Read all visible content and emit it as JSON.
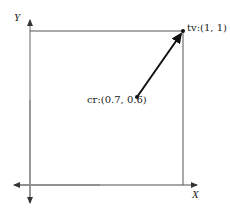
{
  "diagram": {
    "axes": {
      "x_label": "X",
      "y_label": "Y"
    },
    "points": [
      {
        "id": "tv",
        "label": "tv:(1, 1)",
        "x": 1,
        "y": 1
      },
      {
        "id": "cr",
        "label": "cr:(0.7, 0.6)",
        "x": 0.7,
        "y": 0.6
      }
    ],
    "arrow": {
      "from": "cr",
      "to": "tv"
    },
    "unit_square": {
      "x_range": [
        0,
        1
      ],
      "y_range": [
        0,
        1
      ]
    },
    "colors": {
      "axis": "#8a8a8a",
      "square": "#555555",
      "arrow": "#1a1a1a",
      "text": "#222222"
    }
  }
}
